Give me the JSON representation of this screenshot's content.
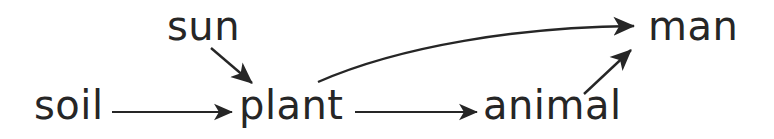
{
  "diagram": {
    "background_color": "#ffffff",
    "ink_color": "#262626",
    "nodes": [
      {
        "id": "soil",
        "label": "soil",
        "x": 34,
        "y": 85
      },
      {
        "id": "sun",
        "label": "sun",
        "x": 167,
        "y": 6
      },
      {
        "id": "plant",
        "label": "plant",
        "x": 239,
        "y": 85
      },
      {
        "id": "animal",
        "label": "animal",
        "x": 483,
        "y": 85
      },
      {
        "id": "man",
        "label": "man",
        "x": 648,
        "y": 6
      }
    ],
    "edges": [
      {
        "id": "soil-to-plant",
        "from": "soil",
        "to": "plant",
        "style": "straight",
        "direction": "right"
      },
      {
        "id": "sun-to-plant",
        "from": "sun",
        "to": "plant",
        "style": "straight",
        "direction": "down-right"
      },
      {
        "id": "plant-to-animal",
        "from": "plant",
        "to": "animal",
        "style": "straight",
        "direction": "right"
      },
      {
        "id": "plant-to-man",
        "from": "plant",
        "to": "man",
        "style": "curved",
        "direction": "up-right"
      },
      {
        "id": "animal-to-man",
        "from": "animal",
        "to": "man",
        "style": "straight",
        "direction": "up-right"
      }
    ]
  }
}
